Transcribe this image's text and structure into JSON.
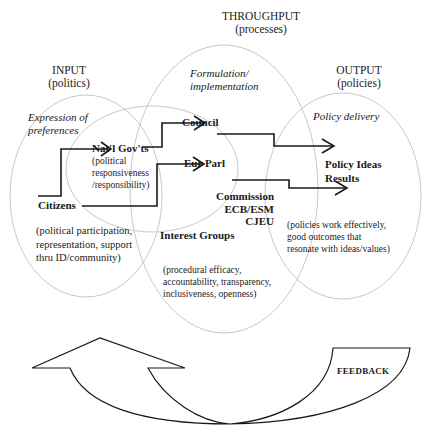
{
  "stages": {
    "input": {
      "title": "INPUT",
      "subtitle": "(politics)",
      "phase": "Expression of preferences"
    },
    "throughput": {
      "title": "THROUGHPUT",
      "subtitle": "(processes)",
      "phase_line1": "Formulation/",
      "phase_line2": "implementation"
    },
    "output": {
      "title": "OUTPUT",
      "subtitle": "(policies)",
      "phase": "Policy delivery"
    }
  },
  "input_labels": {
    "phase_line1": "Expression of",
    "phase_line2": "preferences",
    "citizens": "Citizens",
    "citizens_desc": [
      "(political participation,",
      "representation, support",
      "thru ID/community)"
    ]
  },
  "nat_govts": {
    "label": "Nat'l Gov'ts",
    "desc": [
      "(political",
      "responsiveness",
      "/responsibility)"
    ]
  },
  "throughput_labels": {
    "council": "Council",
    "eur_parl": "Eur Parl",
    "commission": [
      "Commission",
      "ECB/ESM",
      "CJEU"
    ],
    "interest_groups": "Interest Groups",
    "interest_desc": [
      "(procedural efficacy,",
      "accountability, transparency,",
      "inclusiveness, openness)"
    ]
  },
  "output_labels": {
    "policy_ideas": "Policy Ideas",
    "results": "Results",
    "desc": [
      "(policies work effectively,",
      "good outcomes that",
      "resonate with ideas/values)"
    ]
  },
  "feedback": {
    "label": "FEEDBACK"
  },
  "colors": {
    "circle_stroke": "#c8c8c8",
    "arrow_stroke": "#1a1a1a"
  }
}
